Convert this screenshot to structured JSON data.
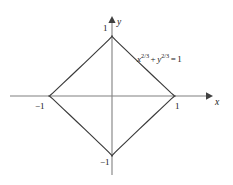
{
  "figure": {
    "type": "astroid-curve-plot",
    "background_color": "#ffffff",
    "curve_color": "#3a3a3a",
    "axis_color": "#808080",
    "text_color": "#1a1a1a"
  },
  "axes": {
    "x_axis_label": "x",
    "y_axis_label": "y",
    "x_ticks": [
      {
        "label": "−1",
        "value": -1
      },
      {
        "label": "1",
        "value": 1
      }
    ],
    "y_ticks": [
      {
        "label": "1",
        "value": 1
      },
      {
        "label": "−1",
        "value": -1
      }
    ]
  },
  "equation": {
    "full_text": "x^{2/3} + y^{2/3} = 1",
    "base_x": "x",
    "exponent_x": "2/3",
    "operator": "+",
    "base_y": "y",
    "exponent_y": "2/3",
    "equals": "=",
    "right_side": "1"
  },
  "chart_data": {
    "type": "line",
    "title": "",
    "subtitle": "",
    "xlabel": "x",
    "ylabel": "y",
    "xlim": [
      -1.6,
      1.6
    ],
    "ylim": [
      -1.3,
      1.3
    ],
    "grid": false,
    "legend_position": "none",
    "annotations": [
      {
        "text": "x^{2/3} + y^{2/3} = 1",
        "x": 0.42,
        "y": 0.68
      }
    ],
    "xticks": [
      -1,
      1
    ],
    "xticklabels": [
      "−1",
      "1"
    ],
    "yticks": [
      -1,
      1
    ],
    "yticklabels": [
      "1",
      "−1"
    ],
    "series": [
      {
        "name": "astroid",
        "equation": "x^(2/3) + y^(2/3) = 1",
        "parametric": "x = cos^3(t), y = sin^3(t), t in [0, 2pi]",
        "closed": true,
        "cusps": [
          {
            "x": 1,
            "y": 0
          },
          {
            "x": 0,
            "y": 1
          },
          {
            "x": -1,
            "y": 0
          },
          {
            "x": 0,
            "y": -1
          }
        ],
        "x": [
          1.0,
          0.985,
          0.941,
          0.87,
          0.778,
          0.67,
          0.553,
          0.433,
          0.317,
          0.21,
          0.118,
          0.049,
          0.008,
          0.0,
          -0.008,
          -0.049,
          -0.118,
          -0.21,
          -0.317,
          -0.433,
          -0.553,
          -0.67,
          -0.778,
          -0.87,
          -0.941,
          -0.985,
          -1.0,
          -0.985,
          -0.941,
          -0.87,
          -0.778,
          -0.67,
          -0.553,
          -0.433,
          -0.317,
          -0.21,
          -0.118,
          -0.049,
          -0.008,
          0.0,
          0.008,
          0.049,
          0.118,
          0.21,
          0.317,
          0.433,
          0.553,
          0.67,
          0.778,
          0.87,
          0.941,
          0.985,
          1.0
        ],
        "y": [
          0.0,
          0.008,
          0.049,
          0.118,
          0.21,
          0.317,
          0.433,
          0.553,
          0.67,
          0.778,
          0.87,
          0.941,
          0.985,
          1.0,
          0.985,
          0.941,
          0.87,
          0.778,
          0.67,
          0.553,
          0.433,
          0.317,
          0.21,
          0.118,
          0.049,
          0.008,
          0.0,
          -0.008,
          -0.049,
          -0.118,
          -0.21,
          -0.317,
          -0.433,
          -0.553,
          -0.67,
          -0.778,
          -0.87,
          -0.941,
          -0.985,
          -1.0,
          -0.985,
          -0.941,
          -0.87,
          -0.778,
          -0.67,
          -0.553,
          -0.433,
          -0.317,
          -0.21,
          -0.118,
          -0.049,
          -0.008,
          0.0
        ]
      }
    ]
  }
}
